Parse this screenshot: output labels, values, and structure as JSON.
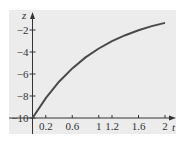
{
  "chart_data": {
    "type": "line",
    "title": "",
    "xlabel": "t",
    "ylabel": "z",
    "xlim": [
      0,
      2
    ],
    "ylim": [
      -10,
      0
    ],
    "x_ticks": [
      0.2,
      0.6,
      1,
      1.2,
      1.6,
      2
    ],
    "x_tick_labels": [
      "0.2",
      "0.6",
      "1",
      "1.2",
      "1.6",
      "2"
    ],
    "y_ticks": [
      -2,
      -4,
      -6,
      -8,
      -10
    ],
    "y_tick_labels": [
      "−2",
      "−4",
      "−6",
      "−8",
      "−10"
    ],
    "grid": false,
    "legend": null,
    "series": [
      {
        "name": "z(t)",
        "x": [
          0,
          0.2,
          0.4,
          0.6,
          0.8,
          1.0,
          1.2,
          1.4,
          1.6,
          1.8,
          2.0
        ],
        "values": [
          -10,
          -8.19,
          -6.7,
          -5.49,
          -4.49,
          -3.68,
          -3.01,
          -2.47,
          -2.02,
          -1.65,
          -1.35
        ]
      }
    ]
  },
  "colors": {
    "panel_background": "#ececec",
    "axis": "#333333",
    "curve": "#4a4a4a"
  }
}
